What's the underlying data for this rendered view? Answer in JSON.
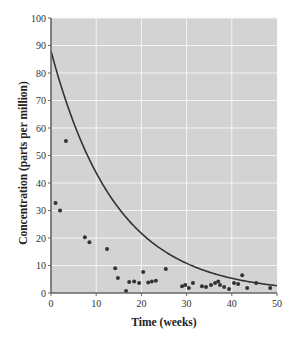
{
  "chart_data": {
    "type": "scatter",
    "title": "",
    "xlabel": "Time (weeks)",
    "ylabel": "Concentration (parts per million)",
    "xlim": [
      0,
      50
    ],
    "ylim": [
      0,
      100
    ],
    "x_ticks": [
      0,
      10,
      20,
      30,
      40,
      50
    ],
    "y_ticks": [
      0,
      10,
      20,
      30,
      40,
      50,
      60,
      70,
      80,
      90,
      100
    ],
    "grid": true,
    "legend": null,
    "colors": {
      "plot_background": "#d3d3d3",
      "grid": "#f4f4f4",
      "points": "#333333",
      "curve": "#333333",
      "axis": "#666666"
    },
    "series": [
      {
        "name": "observed",
        "type": "scatter",
        "points": [
          [
            1.0,
            32.7
          ],
          [
            2.0,
            30.0
          ],
          [
            3.3,
            55.3
          ],
          [
            7.5,
            20.3
          ],
          [
            8.5,
            18.5
          ],
          [
            12.4,
            16.0
          ],
          [
            14.2,
            9.0
          ],
          [
            14.8,
            5.5
          ],
          [
            16.6,
            0.7
          ],
          [
            17.3,
            4.0
          ],
          [
            18.4,
            4.2
          ],
          [
            19.5,
            3.6
          ],
          [
            20.4,
            7.6
          ],
          [
            21.5,
            3.8
          ],
          [
            22.3,
            4.2
          ],
          [
            23.2,
            4.5
          ],
          [
            25.4,
            8.7
          ],
          [
            29.0,
            2.5
          ],
          [
            29.7,
            2.9
          ],
          [
            30.5,
            1.8
          ],
          [
            31.4,
            3.6
          ],
          [
            33.4,
            2.5
          ],
          [
            34.3,
            2.2
          ],
          [
            35.4,
            2.9
          ],
          [
            36.3,
            3.6
          ],
          [
            37.0,
            4.2
          ],
          [
            37.4,
            2.9
          ],
          [
            38.3,
            2.2
          ],
          [
            39.4,
            1.5
          ],
          [
            40.5,
            3.6
          ],
          [
            41.4,
            3.3
          ],
          [
            42.3,
            6.5
          ],
          [
            43.4,
            1.8
          ],
          [
            45.4,
            3.6
          ],
          [
            48.5,
            1.8
          ]
        ]
      },
      {
        "name": "exponential model",
        "type": "line",
        "equation": "y = 88 * exp(-0.07 * x)",
        "a": 88,
        "k": 0.07
      }
    ]
  }
}
